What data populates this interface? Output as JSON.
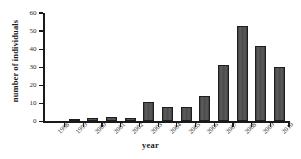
{
  "chart_data": {
    "type": "bar",
    "title": "",
    "xlabel": "year",
    "ylabel": "number of individuals",
    "categories": [
      "1998",
      "1999",
      "2000",
      "2001",
      "2002",
      "2003",
      "2004",
      "2005",
      "2006",
      "2007",
      "2008",
      "2009",
      "2010"
    ],
    "values": [
      0,
      1,
      2,
      2.5,
      2,
      11,
      8,
      8,
      14,
      31,
      53,
      42,
      30
    ],
    "ylim": [
      0,
      60
    ],
    "yticks": [
      0,
      10,
      20,
      30,
      40,
      50,
      60
    ],
    "ytick_labels": [
      "0",
      "10",
      "20",
      "30",
      "40",
      "50",
      "60"
    ],
    "grid": false,
    "legend": null,
    "bar_color": "#4d4d4d",
    "bar_edge_color": "#1e1e1e",
    "axis_color": "#1a1a1a",
    "background": "#ffffff"
  }
}
